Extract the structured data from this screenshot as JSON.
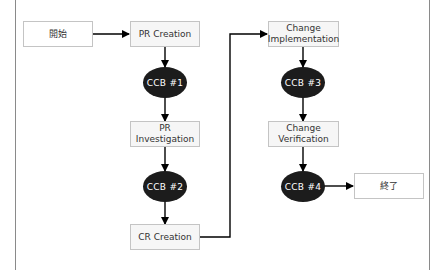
{
  "diagram": {
    "type": "flowchart",
    "nodes": {
      "start": {
        "label": "開始",
        "shape": "rectangle"
      },
      "pr_creation": {
        "label": "PR Creation",
        "shape": "rectangle"
      },
      "ccb1": {
        "label": "CCB #1",
        "shape": "ellipse"
      },
      "pr_investigation": {
        "label": "PR Investigation",
        "shape": "rectangle"
      },
      "ccb2": {
        "label": "CCB #2",
        "shape": "ellipse"
      },
      "cr_creation": {
        "label": "CR Creation",
        "shape": "rectangle"
      },
      "change_implementation": {
        "label": "Change\nImplementation",
        "shape": "rectangle"
      },
      "ccb3": {
        "label": "CCB #3",
        "shape": "ellipse"
      },
      "change_verification": {
        "label": "Change\nVerification",
        "shape": "rectangle"
      },
      "ccb4": {
        "label": "CCB #4",
        "shape": "ellipse"
      },
      "end": {
        "label": "終了",
        "shape": "rectangle"
      }
    },
    "edges": [
      {
        "from": "開始",
        "to": "PR Creation"
      },
      {
        "from": "PR Creation",
        "to": "CCB #1"
      },
      {
        "from": "CCB #1",
        "to": "PR Investigation"
      },
      {
        "from": "PR Investigation",
        "to": "CCB #2"
      },
      {
        "from": "CCB #2",
        "to": "CR Creation"
      },
      {
        "from": "CR Creation",
        "to": "Change Implementation"
      },
      {
        "from": "Change Implementation",
        "to": "CCB #3"
      },
      {
        "from": "CCB #3",
        "to": "Change Verification"
      },
      {
        "from": "Change Verification",
        "to": "CCB #4"
      },
      {
        "from": "CCB #4",
        "to": "終了"
      }
    ],
    "colors": {
      "box_fill": "#f6f6f6",
      "box_border": "#c4c4c4",
      "ellipse_fill": "#1c1c1c",
      "ellipse_text": "#ffffff",
      "arrow": "#000000",
      "frame": "#8a8a8a"
    }
  }
}
